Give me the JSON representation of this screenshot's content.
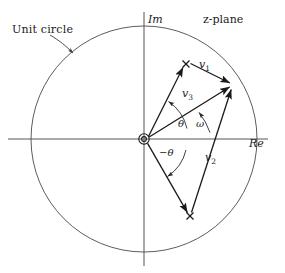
{
  "figure": {
    "title_label": "z-plane",
    "annotation_label": "Unit circle",
    "axes": {
      "imaginary_label": "Im",
      "real_label": "Re"
    },
    "vectors": [
      {
        "id": "v1",
        "label_base": "v",
        "label_sub": "1",
        "label": "v1",
        "from": "upper-pole",
        "to": "circle-point"
      },
      {
        "id": "v2",
        "label_base": "v",
        "label_sub": "2",
        "label": "v2",
        "from": "lower-pole",
        "to": "circle-point"
      },
      {
        "id": "v3",
        "label_base": "v",
        "label_sub": "3",
        "label": "v3",
        "from": "origin",
        "to": "circle-point"
      }
    ],
    "angles": [
      {
        "id": "theta",
        "label": "θ"
      },
      {
        "id": "neg-theta",
        "label": "−θ"
      },
      {
        "id": "omega",
        "label": "ω"
      }
    ],
    "markers": [
      {
        "id": "pole-upper",
        "glyph": "×"
      },
      {
        "id": "pole-lower",
        "glyph": "×"
      }
    ],
    "geometry": {
      "origin": {
        "x": 144,
        "y": 139
      },
      "radius": 113,
      "circle_point": {
        "x": 232,
        "y": 85
      },
      "pole_upper": {
        "x": 186,
        "y": 64
      },
      "pole_lower": {
        "x": 190,
        "y": 216
      }
    },
    "colors": {
      "stroke": "#3a3a3a",
      "vector_stroke": "#1a1a1a",
      "text": "#1a1a1a",
      "background": "#ffffff"
    }
  }
}
